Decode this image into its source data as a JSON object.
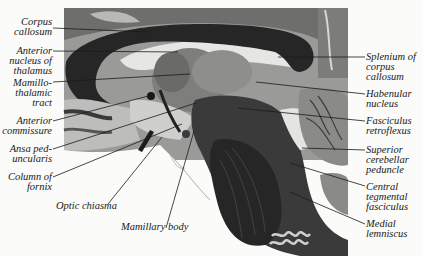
{
  "figure": {
    "colors": {
      "background": "#fbfbf9",
      "white_matter_dark": "#2b2b2b",
      "gray_matter": "#8a8a8a",
      "light_tissue": "#d8d8d6",
      "leader_line": "#1a1a1a"
    }
  },
  "labels_left": [
    {
      "id": "corpus-callosum",
      "text": "Corpus\ncallosum"
    },
    {
      "id": "anterior-nucleus-of-thalamus",
      "text": "Anterior\nnucleus of\nthalamus"
    },
    {
      "id": "mamillothalamic-tract",
      "text": "Mamillo-\nthalamic\ntract"
    },
    {
      "id": "anterior-commissure",
      "text": "Anterior\ncommissure"
    },
    {
      "id": "ansa-peduncularis",
      "text": "Ansa ped-\nuncularis"
    },
    {
      "id": "column-of-fornix",
      "text": "Column of\nfornix"
    }
  ],
  "labels_bottom": [
    {
      "id": "optic-chiasma",
      "text": "Optic chiasma"
    },
    {
      "id": "mamillary-body",
      "text": "Mamillary body"
    }
  ],
  "labels_right": [
    {
      "id": "splenium-of-corpus-callosum",
      "text": "Splenium of\ncorpus\ncallosum"
    },
    {
      "id": "habenular-nucleus",
      "text": "Habenular\nnucleus"
    },
    {
      "id": "fasciculus-retroflexus",
      "text": "Fasciculus\nretroflexus"
    },
    {
      "id": "superior-cerebellar-peduncle",
      "text": "Superior\ncerebellar\npeduncle"
    },
    {
      "id": "central-tegmental-fasciculus",
      "text": "Central\ntegmental\nfasciculus"
    },
    {
      "id": "medial-lemniscus",
      "text": "Medial\nlemniscus"
    }
  ]
}
